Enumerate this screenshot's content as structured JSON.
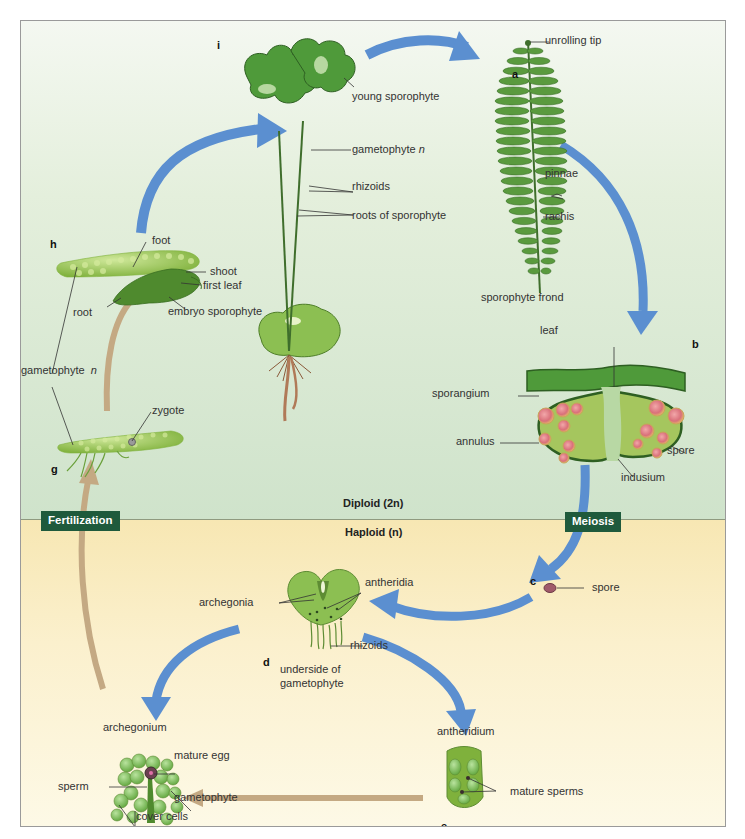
{
  "diagram": {
    "zones": {
      "diploid": "Diploid (2n)",
      "haploid": "Haploid (n)"
    },
    "process_badges": {
      "fertilization": "Fertilization",
      "meiosis": "Meiosis"
    },
    "colors": {
      "diploid_bg": "#d6e8d0",
      "haploid_bg": "#fbf0cd",
      "sporophyte_arrow": "#5b8fd0",
      "gamete_arrow": "#c4a983",
      "badge_bg": "#1f5a3c",
      "plant_green": "#4f9a3a",
      "spore_color": "#a05a6a"
    },
    "stages": {
      "a": {
        "letter": "a",
        "labels": [
          "unrolling tip",
          "pinnae",
          "rachis",
          "sporophyte frond"
        ]
      },
      "b": {
        "letter": "b",
        "labels": [
          "leaf",
          "sporangium",
          "annulus",
          "indusium",
          "spore"
        ]
      },
      "c": {
        "letter": "c",
        "labels": [
          "spore"
        ]
      },
      "d": {
        "letter": "d",
        "labels": [
          "archegonia",
          "antheridia",
          "rhizoids",
          "underside of",
          "gametophyte"
        ]
      },
      "e": {
        "letter": "e",
        "labels": [
          "antheridium",
          "mature sperms"
        ]
      },
      "f": {
        "letter": "f",
        "labels": [
          "archegonium",
          "mature egg",
          "sperm",
          "gametophyte",
          "cover cells"
        ]
      },
      "g": {
        "letter": "g",
        "labels": [
          "zygote"
        ]
      },
      "h": {
        "letter": "h",
        "labels": [
          "foot",
          "shoot",
          "first leaf",
          "root",
          "embryo sporophyte"
        ]
      },
      "i": {
        "letter": "i",
        "labels": [
          "young sporophyte",
          "gametophyte",
          "rhizoids",
          "roots of  sporophyte"
        ]
      }
    },
    "shared_labels": {
      "gametophyte_n": "gametophyte",
      "n_symbol": "n"
    }
  }
}
